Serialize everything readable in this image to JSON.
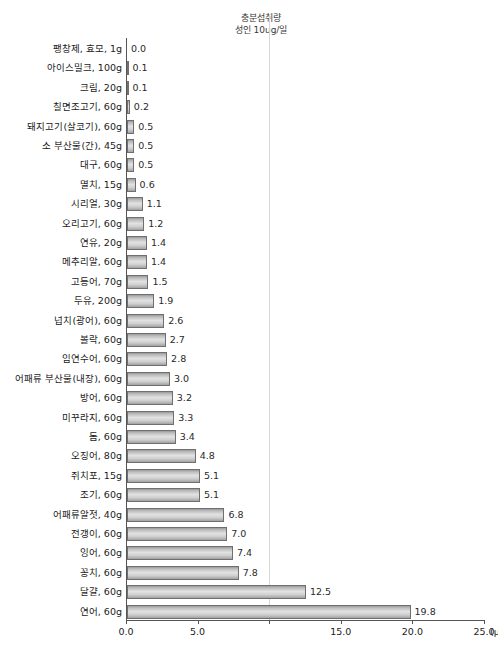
{
  "annotation": {
    "line1": "충분섭취량",
    "line2": "성인 10ug/일"
  },
  "axis": {
    "unit": "(µg)"
  },
  "chart_data": {
    "type": "bar",
    "orientation": "horizontal",
    "title": "",
    "subtitle": "",
    "xlabel": "(µg)",
    "ylabel": "",
    "xlim": [
      0.0,
      25.0
    ],
    "xticks": [
      0.0,
      5.0,
      10.0,
      15.0,
      20.0,
      25.0
    ],
    "xtick_labels": [
      "0.0",
      "5.0",
      "",
      "15.0",
      "20.0",
      "25.0"
    ],
    "grid": false,
    "legend": "none",
    "reference_line": {
      "value": 10.0,
      "label_line1": "충분섭취량",
      "label_line2": "성인 10ug/일",
      "color": "#d6d6d6"
    },
    "bar_color": "#cfcfcf",
    "bar_border_color": "#6f6f6f",
    "categories": [
      "팽창제, 효모, 1g",
      "아이스밀크, 100g",
      "크림, 20g",
      "칠면조고기, 60g",
      "돼지고기(살코기), 60g",
      "소 부산물(간), 45g",
      "대구, 60g",
      "멸치, 15g",
      "시리얼, 30g",
      "오리고기, 60g",
      "연유, 20g",
      "메추리알, 60g",
      "고등어, 70g",
      "두유, 200g",
      "넙치(광어), 60g",
      "볼락, 60g",
      "임연수어, 60g",
      "어패류 부산물(내장), 60g",
      "방어, 60g",
      "미꾸라지, 60g",
      "돔, 60g",
      "오징어, 80g",
      "쥐치포, 15g",
      "조기, 60g",
      "어패류알젓, 40g",
      "전갱이, 60g",
      "잉어, 60g",
      "꽁치, 60g",
      "달걀, 60g",
      "연어, 60g"
    ],
    "values": [
      0.0,
      0.1,
      0.1,
      0.2,
      0.5,
      0.5,
      0.5,
      0.6,
      1.1,
      1.2,
      1.4,
      1.4,
      1.5,
      1.9,
      2.6,
      2.7,
      2.8,
      3.0,
      3.2,
      3.3,
      3.4,
      4.8,
      5.1,
      5.1,
      6.8,
      7.0,
      7.4,
      7.8,
      12.5,
      19.8
    ],
    "value_labels": [
      "0.0",
      "0.1",
      "0.1",
      "0.2",
      "0.5",
      "0.5",
      "0.5",
      "0.6",
      "1.1",
      "1.2",
      "1.4",
      "1.4",
      "1.5",
      "1.9",
      "2.6",
      "2.7",
      "2.8",
      "3.0",
      "3.2",
      "3.3",
      "3.4",
      "4.8",
      "5.1",
      "5.1",
      "6.8",
      "7.0",
      "7.4",
      "7.8",
      "12.5",
      "19.8"
    ]
  }
}
